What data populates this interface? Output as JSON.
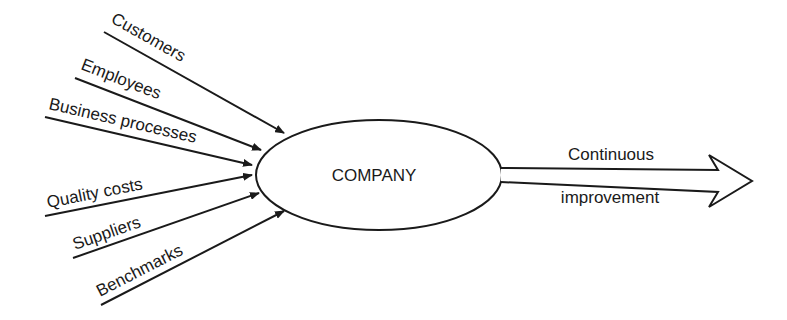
{
  "diagram": {
    "center": {
      "label": "COMPANY"
    },
    "inputs": [
      {
        "label": "Customers"
      },
      {
        "label": "Employees"
      },
      {
        "label": "Business processes"
      },
      {
        "label": "Quality costs"
      },
      {
        "label": "Suppliers"
      },
      {
        "label": "Benchmarks"
      }
    ],
    "output": {
      "label_top": "Continuous",
      "label_bottom": "improvement"
    },
    "colors": {
      "ink": "#1a1a1a",
      "background": "#ffffff"
    }
  }
}
